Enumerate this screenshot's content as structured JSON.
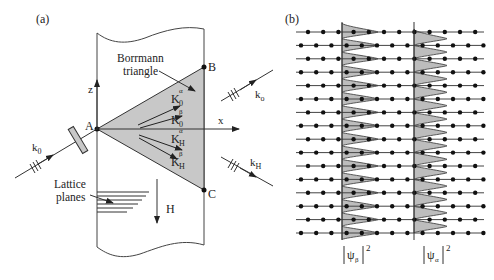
{
  "panel_a": {
    "label": "(a)",
    "borrmann_label_1": "Borrmann",
    "borrmann_label_2": "triangle",
    "point_a": "A",
    "point_b": "B",
    "point_c": "C",
    "axis_z": "z",
    "axis_x": "x",
    "k0_in": "k",
    "k0_in_sub": "0",
    "k0_out": "k",
    "k0_out_sub": "o",
    "kh_out": "k",
    "kh_out_sub": "H",
    "wave_vectors": [
      {
        "main": "K",
        "sub": "0",
        "sup": "α"
      },
      {
        "main": "K",
        "sub": "0",
        "sup": "β"
      },
      {
        "main": "K",
        "sub": "H",
        "sup": "α"
      },
      {
        "main": "K",
        "sub": "H",
        "sup": "β"
      }
    ],
    "lattice_label_1": "Lattice",
    "lattice_label_2": "planes",
    "h_label": "H",
    "colors": {
      "triangle_fill": "#c8c8c8",
      "line": "#333333"
    }
  },
  "panel_b": {
    "label": "(b)",
    "psi_beta": "ψ",
    "psi_beta_sub": "β",
    "psi_alpha": "ψ",
    "psi_alpha_sub": "α",
    "power": "2",
    "rows": 16,
    "colors": {
      "profile_fill": "#bdbdbd",
      "line": "#333333",
      "dot": "#111111"
    }
  }
}
